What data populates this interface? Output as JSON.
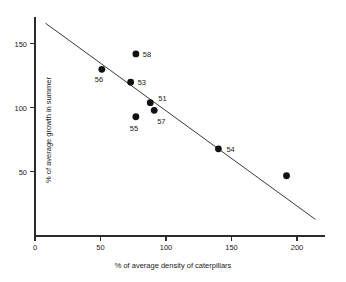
{
  "chart_data": {
    "type": "scatter",
    "title": "",
    "subtitle": "",
    "xlabel": "% of average density of caterpillars",
    "ylabel": "% of average growth in summer",
    "xlim": [
      0,
      215
    ],
    "ylim": [
      0,
      172
    ],
    "xticks": [
      0,
      50,
      100,
      150,
      200
    ],
    "xtick_labels": [
      "0",
      "50",
      "100",
      "150",
      "200"
    ],
    "yticks": [
      50,
      100,
      150
    ],
    "ytick_labels": [
      "50",
      "100",
      "150"
    ],
    "grid": false,
    "legend": false,
    "points": [
      {
        "label": "56",
        "x": 51,
        "y": 130,
        "label_dx": -7,
        "label_dy": 13
      },
      {
        "label": "58",
        "x": 77,
        "y": 142,
        "label_dx": 7,
        "label_dy": 3
      },
      {
        "label": "53",
        "x": 73,
        "y": 120,
        "label_dx": 7,
        "label_dy": 3
      },
      {
        "label": "51",
        "x": 88,
        "y": 104,
        "label_dx": 8,
        "label_dy": -2
      },
      {
        "label": "57",
        "x": 91,
        "y": 98,
        "label_dx": 3,
        "label_dy": 14
      },
      {
        "label": "55",
        "x": 77,
        "y": 93,
        "label_dx": -6,
        "label_dy": 14
      },
      {
        "label": "54",
        "x": 140,
        "y": 68,
        "label_dx": 8,
        "label_dy": 3
      },
      {
        "label": "",
        "x": 192,
        "y": 47,
        "label_dx": 0,
        "label_dy": 0
      }
    ],
    "fit_line": {
      "x0": 8,
      "y0": 166,
      "x1": 214,
      "y1": 13
    }
  }
}
